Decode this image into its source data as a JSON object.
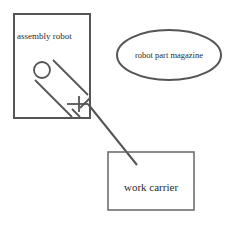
{
  "diagram": {
    "nodes": [
      {
        "id": "assembly_robot",
        "label": "assembly robot",
        "shape": "rectangle"
      },
      {
        "id": "robot_part_magazine",
        "label": "robot part magazine",
        "shape": "ellipse"
      },
      {
        "id": "work_carrier",
        "label": "work carrier",
        "shape": "rectangle"
      }
    ],
    "edges": [
      {
        "from": "assembly_robot",
        "to": "work_carrier",
        "style": "robot arm line"
      }
    ]
  },
  "colors": {
    "stroke": "#555555",
    "text": "#2a2a2a",
    "background": "#ffffff"
  }
}
